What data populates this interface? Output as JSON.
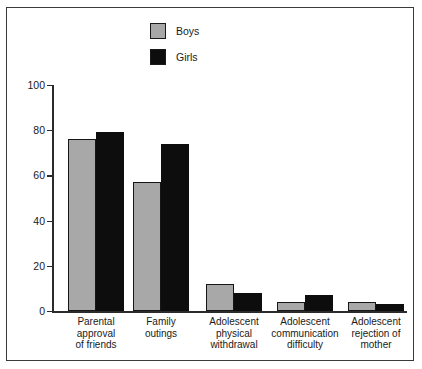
{
  "chart_data": {
    "type": "bar",
    "title": "",
    "subtitle": "",
    "xlabel": "",
    "ylabel": "",
    "ylim": [
      0,
      100
    ],
    "ytick_labels": [
      "100",
      "80",
      "60",
      "40",
      "20",
      "0"
    ],
    "yticks": [
      100,
      80,
      60,
      40,
      20,
      0
    ],
    "grid": false,
    "legend_position": "top-center",
    "categories": [
      "Parental approval of friends",
      "Family outings",
      "Adolescent physical withdrawal",
      "Adolescent communication difficulty",
      "Adolescent rejection of mother"
    ],
    "category_lines": [
      [
        "Parental",
        "approval",
        "of friends"
      ],
      [
        "Family",
        "outings"
      ],
      [
        "Adolescent",
        "physical",
        "withdrawal"
      ],
      [
        "Adolescent",
        "communication",
        "difficulty"
      ],
      [
        "Adolescent",
        "rejection of",
        "mother"
      ]
    ],
    "series": [
      {
        "name": "Boys",
        "color": "#a8a8a8",
        "values": [
          76,
          57,
          12,
          4,
          4
        ]
      },
      {
        "name": "Girls",
        "color": "#0d0d0d",
        "values": [
          79,
          74,
          8,
          7,
          3
        ]
      }
    ]
  },
  "legend": {
    "items": [
      {
        "label": "Boys",
        "swatch": "gray-swatch-icon"
      },
      {
        "label": "Girls",
        "swatch": "black-swatch-icon"
      }
    ]
  },
  "axis": {
    "y_labels": [
      "100",
      "80",
      "60",
      "40",
      "20",
      "0"
    ]
  }
}
